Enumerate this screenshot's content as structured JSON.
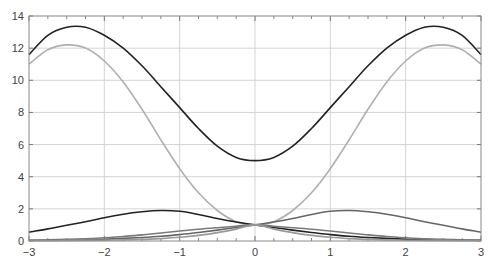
{
  "chart_data": {
    "type": "line",
    "title": "",
    "xlabel": "",
    "ylabel": "",
    "xlim": [
      -3,
      3
    ],
    "ylim": [
      0,
      14
    ],
    "grid": true,
    "legend": null,
    "x_ticks": [
      -3,
      -2,
      -1,
      0,
      1,
      2,
      3
    ],
    "x_tick_labels": [
      "−3",
      "−2",
      "−1",
      "0",
      "1",
      "2",
      "3"
    ],
    "y_ticks": [
      0,
      2,
      4,
      6,
      8,
      10,
      12,
      14
    ],
    "y_tick_labels": [
      "0",
      "2",
      "4",
      "6",
      "8",
      "10",
      "12",
      "14"
    ],
    "x": [
      -3,
      -2.75,
      -2.5,
      -2.25,
      -2,
      -1.75,
      -1.5,
      -1.25,
      -1,
      -0.75,
      -0.5,
      -0.25,
      0,
      0.25,
      0.5,
      0.75,
      1,
      1.25,
      1.5,
      1.75,
      2,
      2.25,
      2.5,
      2.75,
      3
    ],
    "series": [
      {
        "name": "upper-dark",
        "color": "#222222",
        "values": [
          11.6,
          12.8,
          13.3,
          13.3,
          12.8,
          12.0,
          10.9,
          9.6,
          8.3,
          7.0,
          5.9,
          5.2,
          5.0,
          5.2,
          5.9,
          7.0,
          8.3,
          9.6,
          10.9,
          12.0,
          12.8,
          13.3,
          13.3,
          12.8,
          11.6
        ]
      },
      {
        "name": "upper-light",
        "color": "#b0b0b0",
        "values": [
          11.0,
          11.9,
          12.2,
          12.0,
          11.2,
          9.9,
          8.2,
          6.3,
          4.5,
          3.0,
          1.9,
          1.2,
          1.0,
          1.2,
          1.9,
          3.0,
          4.5,
          6.3,
          8.2,
          9.9,
          11.2,
          12.0,
          12.2,
          11.9,
          11.0
        ]
      },
      {
        "name": "lower-dark-left-peak",
        "color": "#222222",
        "values": [
          0.55,
          0.75,
          0.98,
          1.2,
          1.45,
          1.67,
          1.82,
          1.9,
          1.85,
          1.65,
          1.4,
          1.18,
          1.0,
          0.84,
          0.68,
          0.53,
          0.4,
          0.3,
          0.22,
          0.16,
          0.11,
          0.08,
          0.06,
          0.05,
          0.05
        ]
      },
      {
        "name": "lower-gray-right-peak",
        "color": "#666666",
        "values": [
          0.05,
          0.05,
          0.06,
          0.08,
          0.11,
          0.16,
          0.22,
          0.3,
          0.4,
          0.53,
          0.68,
          0.84,
          1.0,
          1.18,
          1.4,
          1.65,
          1.85,
          1.9,
          1.82,
          1.67,
          1.45,
          1.2,
          0.98,
          0.75,
          0.55
        ]
      },
      {
        "name": "lower-gray-rising",
        "color": "#7a7a7a",
        "values": [
          0.05,
          0.07,
          0.1,
          0.14,
          0.2,
          0.28,
          0.38,
          0.5,
          0.62,
          0.73,
          0.83,
          0.92,
          1.0,
          0.92,
          0.83,
          0.73,
          0.62,
          0.5,
          0.38,
          0.28,
          0.2,
          0.14,
          0.1,
          0.07,
          0.05
        ]
      },
      {
        "name": "lower-light-steep",
        "color": "#9a9a9a",
        "values": [
          0.02,
          0.02,
          0.03,
          0.04,
          0.05,
          0.07,
          0.1,
          0.15,
          0.23,
          0.35,
          0.52,
          0.74,
          1.0,
          0.74,
          0.52,
          0.35,
          0.23,
          0.15,
          0.1,
          0.07,
          0.05,
          0.04,
          0.03,
          0.02,
          0.02
        ]
      }
    ]
  },
  "plot": {
    "left_px": 29,
    "right_px": 481,
    "top_px": 16,
    "bottom_px": 241,
    "grid_color": "#d4d4d4",
    "frame_color": "#888888",
    "background": "#ffffff"
  }
}
